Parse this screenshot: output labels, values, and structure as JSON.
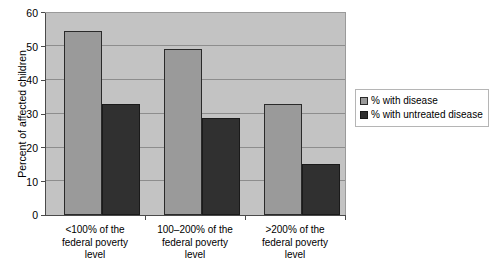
{
  "chart_data": {
    "type": "bar",
    "title": "",
    "xlabel": "",
    "ylabel": "Percent of affected children",
    "ylim": [
      0,
      60
    ],
    "ytick_step": 10,
    "yticks": [
      "60",
      "50",
      "40",
      "30",
      "20",
      "10",
      "0"
    ],
    "grid": true,
    "legend_position": "right",
    "categories": [
      "<100% of the federal poverty level",
      "100–200% of the federal poverty level",
      ">200% of the federal poverty level"
    ],
    "category_lines": [
      [
        "<100% of the",
        "federal poverty",
        "level"
      ],
      [
        "100–200% of the",
        "federal poverty",
        "level"
      ],
      [
        ">200% of the",
        "federal poverty",
        "level"
      ]
    ],
    "series": [
      {
        "name": "% with disease",
        "color": "#9a9a9a",
        "values": [
          54.5,
          49.0,
          32.8
        ]
      },
      {
        "name": "% with untreated disease",
        "color": "#303030",
        "values": [
          32.8,
          28.7,
          15.2
        ]
      }
    ],
    "plot_background_color": "#c3c3c3",
    "page_background_color": "#ffffff",
    "axis_color": "#4a4a4a",
    "gridline_color": "#8d8d8d"
  }
}
